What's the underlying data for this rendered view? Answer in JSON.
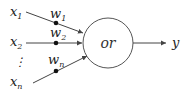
{
  "diagram": {
    "title": "",
    "node": {
      "label": "or",
      "shape": "circle"
    },
    "inputs": [
      {
        "name": "x",
        "sub": "1",
        "weight": "w",
        "weight_sub": "1"
      },
      {
        "name": "x",
        "sub": "2",
        "weight": "w",
        "weight_sub": "2"
      },
      {
        "name": "x",
        "sub": "n",
        "weight": "w",
        "weight_sub": "n"
      }
    ],
    "ellipsis": "⋮",
    "output": {
      "label": "y"
    },
    "colors": {
      "stroke": "#444444",
      "text": "#222222",
      "dot": "#111111"
    }
  }
}
